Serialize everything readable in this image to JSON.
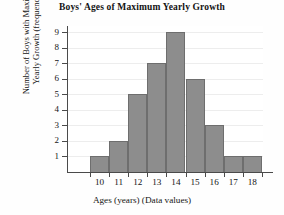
{
  "chart_data": {
    "type": "bar",
    "title": "Boys' Ages of Maximum Yearly Growth",
    "xlabel": "Ages (years) (Data values)",
    "ylabel": "Number of Boys with Maximum Yearly Growth (frequency)",
    "ylabel_lines": [
      "Number of Boys with Maximum",
      "Yearly Growth (frequency)"
    ],
    "categories": [
      "10",
      "11",
      "12",
      "13",
      "14",
      "15",
      "16",
      "17",
      "18"
    ],
    "values": [
      1,
      2,
      5,
      7,
      9,
      6,
      3,
      1,
      1
    ],
    "ytick_labels": [
      "1",
      "2",
      "3",
      "4",
      "5",
      "6",
      "7",
      "8",
      "9"
    ],
    "ylim": [
      0,
      9.4
    ],
    "xlim_note": "bars are contiguous, one per integer age",
    "grid": true,
    "grid_axis": "y",
    "legend": false,
    "legend_position": "none",
    "colors": {
      "bar_fill": "#8d8d8d",
      "bar_edge": "#6e6e6e",
      "axis": "#4a4a4a",
      "gridline": "#ededed",
      "background": "#fefefe",
      "text": "#141414"
    }
  }
}
